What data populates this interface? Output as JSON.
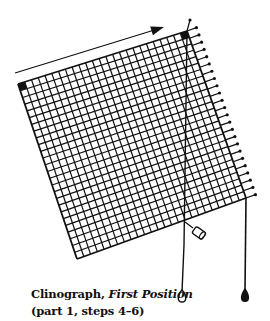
{
  "figure": {
    "title": "Clinograph",
    "subtitle": "First Position",
    "title_separator": ", ",
    "steps_note": "(part 1, steps 4–6)"
  },
  "diagram": {
    "grid": {
      "corners": {
        "tl": [
          18,
          84
        ],
        "tr": [
          187,
          31
        ],
        "br": [
          246,
          198
        ],
        "bl": [
          77,
          259
        ]
      },
      "cols": 25,
      "rows": 26,
      "line_color": "#111111"
    },
    "arrow": {
      "from": [
        15,
        73
      ],
      "to": [
        164,
        27
      ]
    },
    "fringe_count": 24,
    "color": "#111111"
  }
}
